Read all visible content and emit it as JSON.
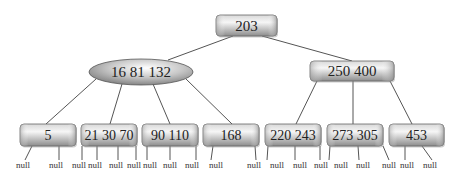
{
  "diagram": {
    "type": "b-tree",
    "root": {
      "id": "root",
      "keys": "203",
      "shape": "rect",
      "x": 216,
      "y": 15,
      "w": 61,
      "h": 21,
      "fontSize": 15
    },
    "internal": [
      {
        "id": "n1",
        "keys": "16 81 132",
        "shape": "ellipse",
        "cx": 141,
        "cy": 72,
        "rx": 52,
        "ry": 13,
        "fontSize": 15
      },
      {
        "id": "n2",
        "keys": "250 400",
        "shape": "rect",
        "x": 310,
        "y": 61,
        "w": 84,
        "h": 20,
        "fontSize": 15
      }
    ],
    "leaves": [
      {
        "id": "l1",
        "keys": "5",
        "x": 20,
        "y": 124,
        "w": 56,
        "h": 22
      },
      {
        "id": "l2",
        "keys": "21 30 70",
        "x": 81,
        "y": 124,
        "w": 56,
        "h": 22
      },
      {
        "id": "l3",
        "keys": "90 110",
        "x": 142,
        "y": 124,
        "w": 56,
        "h": 22
      },
      {
        "id": "l4",
        "keys": "168",
        "x": 203,
        "y": 124,
        "w": 56,
        "h": 22
      },
      {
        "id": "l5",
        "keys": "220 243",
        "x": 265,
        "y": 124,
        "w": 56,
        "h": 22
      },
      {
        "id": "l6",
        "keys": "273 305",
        "x": 327,
        "y": 124,
        "w": 56,
        "h": 22
      },
      {
        "id": "l7",
        "keys": "453",
        "x": 389,
        "y": 124,
        "w": 55,
        "h": 22
      }
    ],
    "edges": [
      {
        "x1": 233,
        "y1": 36,
        "x2": 168,
        "y2": 60
      },
      {
        "x1": 262,
        "y1": 36,
        "x2": 352,
        "y2": 61
      },
      {
        "x1": 96,
        "y1": 79,
        "x2": 46,
        "y2": 124
      },
      {
        "x1": 122,
        "y1": 84,
        "x2": 110,
        "y2": 124
      },
      {
        "x1": 153,
        "y1": 84,
        "x2": 170,
        "y2": 124
      },
      {
        "x1": 186,
        "y1": 79,
        "x2": 232,
        "y2": 124
      },
      {
        "x1": 317,
        "y1": 81,
        "x2": 296,
        "y2": 124
      },
      {
        "x1": 353,
        "y1": 81,
        "x2": 353,
        "y2": 124
      },
      {
        "x1": 390,
        "y1": 81,
        "x2": 412,
        "y2": 124
      }
    ],
    "null_label": "null",
    "null_links": [
      {
        "x1": 32,
        "y1": 146,
        "x2": 25,
        "y2": 160,
        "tx": 23
      },
      {
        "x1": 59,
        "y1": 146,
        "x2": 59,
        "y2": 160,
        "tx": 56
      },
      {
        "x1": 82,
        "y1": 146,
        "x2": 82,
        "y2": 160,
        "tx": 79
      },
      {
        "x1": 97,
        "y1": 146,
        "x2": 97,
        "y2": 160,
        "tx": 95
      },
      {
        "x1": 118,
        "y1": 146,
        "x2": 118,
        "y2": 160,
        "tx": 116
      },
      {
        "x1": 136,
        "y1": 146,
        "x2": 136,
        "y2": 160,
        "tx": 134
      },
      {
        "x1": 147,
        "y1": 146,
        "x2": 147,
        "y2": 160,
        "tx": 150
      },
      {
        "x1": 170,
        "y1": 146,
        "x2": 170,
        "y2": 160,
        "tx": 170
      },
      {
        "x1": 196,
        "y1": 146,
        "x2": 196,
        "y2": 160,
        "tx": 192
      },
      {
        "x1": 213,
        "y1": 146,
        "x2": 211,
        "y2": 160,
        "tx": 216
      },
      {
        "x1": 255,
        "y1": 146,
        "x2": 256,
        "y2": 160,
        "tx": 254
      },
      {
        "x1": 268,
        "y1": 146,
        "x2": 267,
        "y2": 160,
        "tx": 277
      },
      {
        "x1": 295,
        "y1": 146,
        "x2": 295,
        "y2": 160,
        "tx": 300
      },
      {
        "x1": 320,
        "y1": 146,
        "x2": 320,
        "y2": 160,
        "tx": 321
      },
      {
        "x1": 330,
        "y1": 146,
        "x2": 329,
        "y2": 160,
        "tx": 341
      },
      {
        "x1": 358,
        "y1": 146,
        "x2": 359,
        "y2": 160,
        "tx": 363
      },
      {
        "x1": 383,
        "y1": 146,
        "x2": 389,
        "y2": 160,
        "tx": 389
      },
      {
        "x1": 405,
        "y1": 146,
        "x2": 405,
        "y2": 160,
        "tx": 407
      },
      {
        "x1": 422,
        "y1": 146,
        "x2": 432,
        "y2": 160,
        "tx": 430
      }
    ]
  },
  "colors": {
    "node_dark": "#8a8a8a",
    "node_light": "#f4f4f4",
    "node_border": "#666666",
    "edge": "#555555",
    "text": "#222222"
  }
}
